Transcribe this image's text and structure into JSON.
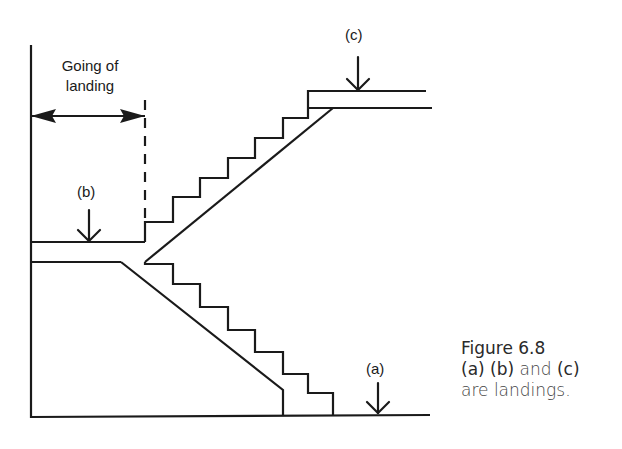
{
  "figure": {
    "dimension_label_line1": "Going of",
    "dimension_label_line2": "landing",
    "landing_labels": {
      "a": "(a)",
      "b": "(b)",
      "c": "(c)"
    },
    "caption": {
      "line1": "Figure 6.8",
      "line2_part1": "(a) (b)",
      "line2_part2": " and ",
      "line2_part3": "(c)",
      "line3": "are landings."
    },
    "colors": {
      "line": "#1a1a1a",
      "background": "#ffffff"
    }
  }
}
